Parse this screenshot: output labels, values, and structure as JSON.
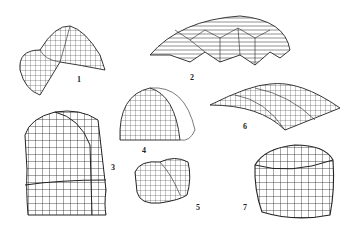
{
  "figure": {
    "ink_color": "#222222",
    "background": "#ffffff",
    "shapes": [
      {
        "id": 1,
        "label": "1",
        "form": "saddle-shaped gridshell"
      },
      {
        "id": 2,
        "label": "2",
        "form": "ribbed dome with hexagonal pattern"
      },
      {
        "id": 3,
        "label": "3",
        "form": "tall vaulted tower gridshell"
      },
      {
        "id": 4,
        "label": "4",
        "form": "half-dome gridshell"
      },
      {
        "id": 5,
        "label": "5",
        "form": "pillow-like double-lobed gridshell"
      },
      {
        "id": 6,
        "label": "6",
        "form": "long barrel vault gridshell"
      },
      {
        "id": 7,
        "label": "7",
        "form": "cushion cube gridshell"
      }
    ]
  }
}
